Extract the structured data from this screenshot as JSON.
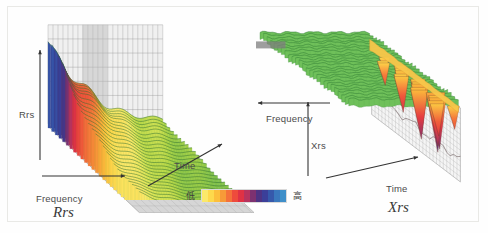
{
  "figure": {
    "background": "#fefefe",
    "border_color": "#e9e9e6"
  },
  "legend": {
    "low_label": "低",
    "high_label": "高",
    "colors": [
      "#fbe96a",
      "#fdd94c",
      "#fcbf3c",
      "#f79a38",
      "#f4713a",
      "#ee4b3c",
      "#e03244",
      "#b8335e",
      "#7d3170",
      "#4e3383",
      "#3b3f99",
      "#3659ab",
      "#3a78bd",
      "#3f8fc9"
    ]
  },
  "panels": [
    {
      "id": "rrs",
      "title": "Rrs",
      "vertical_axis": "Rrs",
      "depth_axis": "Frequency",
      "horizontal_axis": "Time"
    },
    {
      "id": "xrs",
      "title": "Xrs",
      "vertical_axis": "Xrs",
      "depth_axis": "Frequency",
      "horizontal_axis": "Time"
    }
  ],
  "chart_data": [
    {
      "type": "surface",
      "title": "Rrs",
      "xlabel": "Time",
      "ylabel": "Frequency",
      "zlabel": "Rrs",
      "colormap": [
        "#fbe96a",
        "#fdd94c",
        "#fcbf3c",
        "#f79a38",
        "#f4713a",
        "#ee4b3c",
        "#e03244",
        "#b8335e",
        "#7d3170",
        "#4e3383",
        "#3b3f99",
        "#3659ab",
        "#3a78bd",
        "#3f8fc9"
      ],
      "colorbar_low": "低",
      "colorbar_high": "高",
      "grid": true,
      "legend_position": "bottom-center",
      "description": "Waterfall surface of resistance spectra: tall ridges at low Time decaying toward high Time; peak amplitude descends from purple/blue (high) through red and yellow to green (low).",
      "time_steps": [
        1,
        2,
        3,
        4,
        5,
        6,
        7,
        8,
        9,
        10,
        11,
        12,
        13,
        14,
        15,
        16,
        17,
        18,
        19,
        20
      ],
      "ridge_peak_amplitude": [
        1.0,
        0.97,
        0.92,
        0.88,
        0.79,
        0.72,
        0.65,
        0.58,
        0.52,
        0.47,
        0.43,
        0.39,
        0.36,
        0.33,
        0.31,
        0.29,
        0.28,
        0.27,
        0.26,
        0.25
      ],
      "ridge_baseline": [
        0.06,
        0.06,
        0.06,
        0.06,
        0.05,
        0.05,
        0.05,
        0.05,
        0.05,
        0.05,
        0.04,
        0.04,
        0.04,
        0.04,
        0.04,
        0.04,
        0.04,
        0.04,
        0.04,
        0.04
      ],
      "zlim": [
        0,
        1
      ]
    },
    {
      "type": "surface",
      "title": "Xrs",
      "xlabel": "Time",
      "ylabel": "Frequency",
      "zlabel": "Xrs",
      "colormap": [
        "#fbe96a",
        "#fdd94c",
        "#fcbf3c",
        "#f79a38",
        "#f4713a",
        "#ee4b3c",
        "#e03244",
        "#b8335e",
        "#7d3170",
        "#4e3383",
        "#3b3f99",
        "#3659ab",
        "#3a78bd",
        "#3f8fc9"
      ],
      "colorbar_low": "低",
      "colorbar_high": "高",
      "grid": true,
      "legend_position": "bottom-center",
      "description": "Waterfall surface of reactance spectra: mostly flat green plateau with sharp downward negative troughs, deepest troughs colored orange to purple.",
      "time_steps": [
        1,
        2,
        3,
        4,
        5,
        6,
        7,
        8,
        9,
        10,
        11,
        12,
        13,
        14,
        15,
        16,
        17,
        18,
        19,
        20
      ],
      "trough_depth": [
        0.1,
        0.12,
        0.11,
        0.14,
        0.13,
        0.18,
        0.22,
        0.3,
        0.26,
        0.44,
        0.35,
        0.52,
        0.4,
        0.66,
        0.48,
        0.82,
        0.55,
        0.7,
        0.45,
        0.3
      ],
      "plateau_level": [
        0.92,
        0.94,
        0.91,
        0.95,
        0.93,
        0.96,
        0.92,
        0.95,
        0.94,
        0.96,
        0.93,
        0.95,
        0.94,
        0.96,
        0.93,
        0.95,
        0.94,
        0.96,
        0.93,
        0.95
      ],
      "zlim": [
        0,
        1
      ]
    }
  ]
}
